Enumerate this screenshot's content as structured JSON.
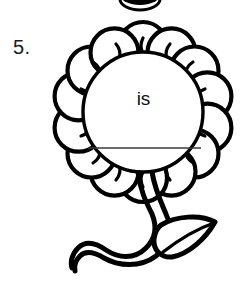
{
  "worksheet": {
    "item_number": "5.",
    "prompt_word": "is",
    "answer_line": {
      "present": true,
      "color": "#3a3a3a"
    }
  },
  "illustration": {
    "name": "flower-line-drawing",
    "description": "Black outline flower with round blank center, scalloped petals, curved stem and single leaf",
    "petal_count": 14,
    "line_color": "#000000",
    "fill_color": "#ffffff",
    "center_circle": {
      "cx": 143,
      "cy": 112,
      "r": 60
    },
    "parts": [
      "petals",
      "center-circle",
      "stem",
      "leaf"
    ]
  },
  "page": {
    "background_color": "#ffffff",
    "width": 252,
    "height": 281,
    "top_fragment_visible": true
  }
}
